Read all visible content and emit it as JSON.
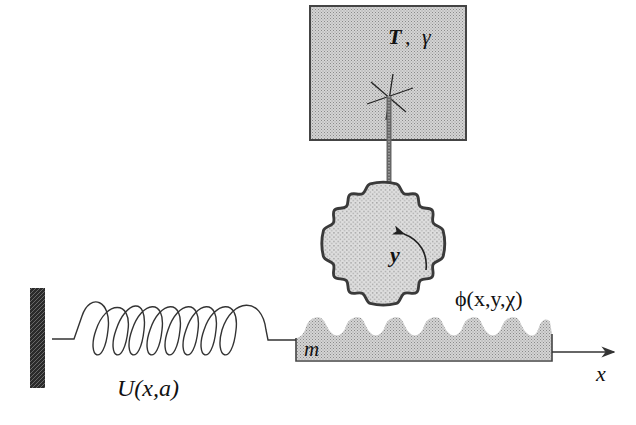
{
  "diagram": {
    "type": "physical-model-schematic",
    "colors": {
      "background": "#ffffff",
      "fill_gray": "#bdbdbd",
      "gear_fill": "#cfcfcf",
      "stroke": "#333333",
      "wall": "#2a2a2a"
    },
    "labels": {
      "bath": "T",
      "bath_sep": ",",
      "bath_gamma": "γ",
      "gear_coord": "y",
      "potential": "ϕ(x,y,χ)",
      "mass": "m",
      "spring": "U(x,a)",
      "axis": "x"
    },
    "elements": [
      {
        "id": "wall",
        "label": "fixed wall"
      },
      {
        "id": "spring",
        "label": "U(x,a)"
      },
      {
        "id": "mass-block",
        "label": "m"
      },
      {
        "id": "gear",
        "label": "y"
      },
      {
        "id": "thermal-bath",
        "label": "T, γ"
      },
      {
        "id": "x-axis",
        "label": "x"
      }
    ]
  }
}
